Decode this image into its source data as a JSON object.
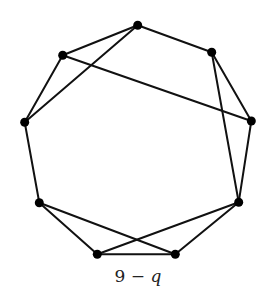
{
  "diagram": {
    "type": "graph",
    "caption": {
      "prefix": "9 − ",
      "variable": "q"
    },
    "colors": {
      "edge": "#111111",
      "vertex": "#000000",
      "background": "#ffffff"
    },
    "vertices": [
      {
        "id": "top",
        "x": 137.7,
        "y": 25.3
      },
      {
        "id": "upper-left",
        "x": 62.7,
        "y": 55.3
      },
      {
        "id": "upper-right",
        "x": 211.7,
        "y": 52.3
      },
      {
        "id": "left",
        "x": 24.7,
        "y": 122.3
      },
      {
        "id": "right",
        "x": 251.3,
        "y": 121.0
      },
      {
        "id": "lower-left",
        "x": 39.3,
        "y": 202.7
      },
      {
        "id": "lower-right",
        "x": 238.7,
        "y": 202.3
      },
      {
        "id": "bottom-left",
        "x": 97.3,
        "y": 254.3
      },
      {
        "id": "bottom-right",
        "x": 175.3,
        "y": 254.3
      }
    ],
    "edges": [
      [
        "top",
        "upper-left"
      ],
      [
        "top",
        "left"
      ],
      [
        "top",
        "upper-right"
      ],
      [
        "upper-left",
        "left"
      ],
      [
        "upper-left",
        "right"
      ],
      [
        "upper-right",
        "right"
      ],
      [
        "upper-right",
        "lower-right"
      ],
      [
        "right",
        "lower-right"
      ],
      [
        "left",
        "lower-left"
      ],
      [
        "lower-left",
        "bottom-left"
      ],
      [
        "lower-left",
        "bottom-right"
      ],
      [
        "bottom-left",
        "bottom-right"
      ],
      [
        "bottom-left",
        "lower-right"
      ],
      [
        "bottom-right",
        "lower-right"
      ]
    ]
  }
}
